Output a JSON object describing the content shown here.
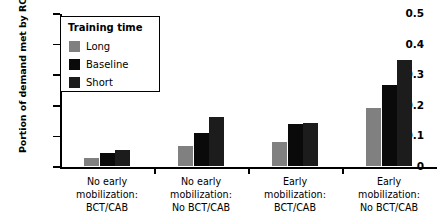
{
  "chart_data": {
    "type": "bar",
    "title": "",
    "xlabel": "",
    "ylabel": "Portion of demand met by RC",
    "ylim": [
      0,
      0.5
    ],
    "yticks": [
      0,
      0.1,
      0.2,
      0.3,
      0.4,
      0.5
    ],
    "ytick_labels": [
      "0",
      "0.1",
      "0.2",
      "0.3",
      "0.4",
      "0.5"
    ],
    "grid": false,
    "legend": {
      "title": "Training time",
      "position": "upper-left-inside",
      "entries": [
        {
          "name": "Long",
          "color": "#808080"
        },
        {
          "name": "Baseline",
          "color": "#0a0a0a"
        },
        {
          "name": "Short",
          "color": "#1c1c1c"
        }
      ]
    },
    "categories": [
      "No early\nmobilization:\nBCT/CAB",
      "No early\nmobilization:\nNo BCT/CAB",
      "Early\nmobilization:\nBCT/CAB",
      "Early\nmobilization:\nNo BCT/CAB"
    ],
    "series": [
      {
        "name": "Long",
        "color": "#808080",
        "values": [
          0.027,
          0.065,
          0.078,
          0.19
        ]
      },
      {
        "name": "Baseline",
        "color": "#0a0a0a",
        "values": [
          0.041,
          0.108,
          0.137,
          0.265
        ]
      },
      {
        "name": "Short",
        "color": "#1c1c1c",
        "values": [
          0.051,
          0.16,
          0.141,
          0.345
        ]
      }
    ]
  }
}
